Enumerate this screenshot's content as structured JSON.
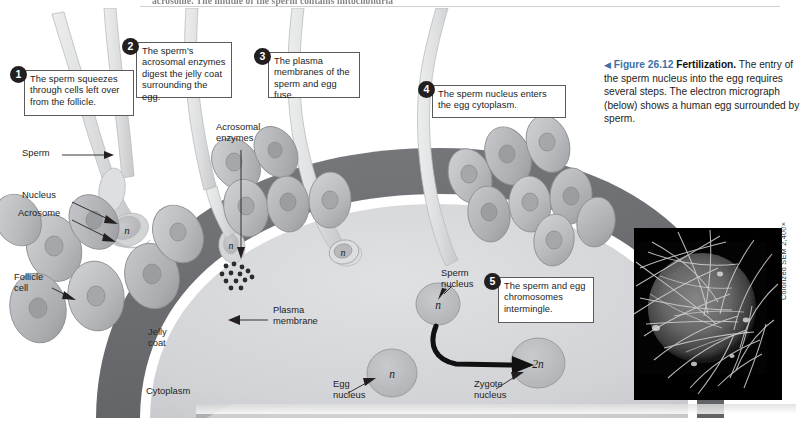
{
  "page": {
    "cut_body_text": "acrosome. The middle of the sperm contains mitochondria",
    "credit": "Colorized SEM 2,400×"
  },
  "caption": {
    "arrow": "◀",
    "figure_number": "Figure 26.12",
    "title": "Fertilization.",
    "body": " The entry of the sperm nucleus into the egg requires several steps. The electron micrograph (below) shows a human egg surrounded by sperm."
  },
  "steps": [
    {
      "num": "1",
      "text": "The sperm squeezes through cells left over from the follicle."
    },
    {
      "num": "2",
      "text": "The sperm's acrosomal enzymes digest the jelly coat surrounding the egg."
    },
    {
      "num": "3",
      "text": "The plasma membranes of the sperm and egg fuse."
    },
    {
      "num": "4",
      "text": "The sperm nucleus enters the egg cytoplasm."
    },
    {
      "num": "5",
      "text": "The sperm and egg chromosomes intermingle."
    }
  ],
  "labels": {
    "sperm": "Sperm",
    "nucleus": "Nucleus",
    "acrosome": "Acrosome",
    "follicle_cell": "Follicle\ncell",
    "acrosomal_enzymes": "Acrosomal\nenzymes",
    "plasma_membrane": "Plasma\nmembrane",
    "jelly_coat": "Jelly\ncoat",
    "cytoplasm": "Cytoplasm",
    "sperm_nucleus": "Sperm\nnucleus",
    "egg_nucleus": "Egg\nnucleus",
    "zygote_nucleus": "Zygote\nnucleus"
  },
  "ploidy": {
    "sperm_head_n": "n",
    "fused_n": "n",
    "sperm_nucleus_n": "n",
    "egg_nucleus_n": "n",
    "zygote_2n": "2n"
  },
  "colors": {
    "jelly_coat": "#6f7276",
    "cytoplasm": "#d5d6d8",
    "plasma_membrane": "#ffffff",
    "follicle_cell": "#bcbec0",
    "follicle_cell_dark": "#a7a9ac",
    "sperm_body": "#dcdddf",
    "nucleus_fill": "#b9babd",
    "accent_blue": "#3d6fa8",
    "ink": "#231f20",
    "micrograph_bg": "#000000"
  }
}
